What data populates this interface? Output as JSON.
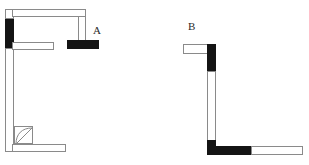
{
  "figure": {
    "type": "architectural-floor-plan-diagram",
    "width": 309,
    "height": 165,
    "background_color": "#ffffff",
    "outline_color": "#8a8a8a",
    "solid_fill_color": "#141414"
  },
  "labels": [
    {
      "id": "label-a",
      "text": "A",
      "x": 93,
      "y": 25
    },
    {
      "id": "label-b",
      "text": "B",
      "x": 188,
      "y": 21
    }
  ],
  "plan_a": {
    "name": "A",
    "segments": [
      {
        "id": "a-left-wall-top-white",
        "kind": "hollow",
        "orientation": "vertical",
        "x": 5,
        "y": 9,
        "w": 9,
        "h": 10
      },
      {
        "id": "a-left-wall-solid",
        "kind": "solid",
        "orientation": "vertical",
        "x": 5,
        "y": 19,
        "w": 9,
        "h": 29
      },
      {
        "id": "a-left-wall-lower-white",
        "kind": "hollow",
        "orientation": "vertical",
        "x": 5,
        "y": 48,
        "w": 9,
        "h": 104
      },
      {
        "id": "a-top-wall",
        "kind": "hollow",
        "orientation": "horizontal",
        "x": 13,
        "y": 9,
        "w": 73,
        "h": 8
      },
      {
        "id": "a-top-wall-return",
        "kind": "hollow",
        "orientation": "vertical",
        "x": 78,
        "y": 16,
        "w": 8,
        "h": 24
      },
      {
        "id": "a-mid-wall",
        "kind": "hollow",
        "orientation": "horizontal",
        "x": 13,
        "y": 42,
        "w": 41,
        "h": 8
      },
      {
        "id": "a-bottom-wall",
        "kind": "hollow",
        "orientation": "horizontal",
        "x": 13,
        "y": 144,
        "w": 53,
        "h": 8
      },
      {
        "id": "a-detached-bar",
        "kind": "solid",
        "orientation": "horizontal",
        "x": 67,
        "y": 40,
        "w": 32,
        "h": 9
      }
    ],
    "door": {
      "id": "a-door",
      "x": 14,
      "y": 126,
      "w": 19,
      "h": 18,
      "swing": "inward-left"
    }
  },
  "plan_b": {
    "name": "B",
    "segments": [
      {
        "id": "b-top-wall",
        "kind": "hollow",
        "orientation": "horizontal",
        "x": 183,
        "y": 44,
        "w": 26,
        "h": 10
      },
      {
        "id": "b-right-wall-solid-top",
        "kind": "solid",
        "orientation": "vertical",
        "x": 207,
        "y": 44,
        "w": 9,
        "h": 28
      },
      {
        "id": "b-right-wall-white",
        "kind": "hollow",
        "orientation": "vertical",
        "x": 207,
        "y": 72,
        "w": 9,
        "h": 68
      },
      {
        "id": "b-corner-solid",
        "kind": "solid",
        "orientation": "vertical",
        "x": 207,
        "y": 140,
        "w": 9,
        "h": 15
      },
      {
        "id": "b-bottom-wall-solid",
        "kind": "solid",
        "orientation": "horizontal",
        "x": 207,
        "y": 146,
        "w": 45,
        "h": 9
      },
      {
        "id": "b-bottom-wall-white",
        "kind": "hollow",
        "orientation": "horizontal",
        "x": 251,
        "y": 146,
        "w": 52,
        "h": 9
      }
    ]
  }
}
